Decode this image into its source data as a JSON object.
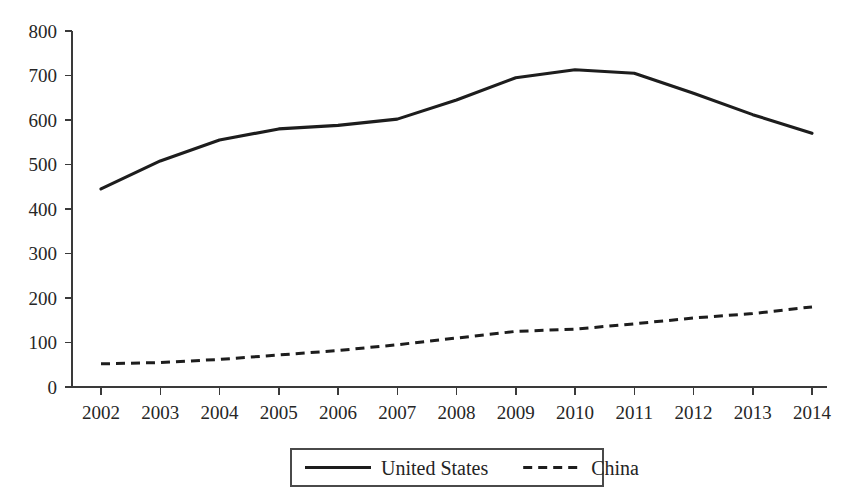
{
  "chart_data": {
    "type": "line",
    "title": "",
    "subtitle": "",
    "xlabel": "",
    "ylabel": "",
    "categories": [
      "2002",
      "2003",
      "2004",
      "2005",
      "2006",
      "2007",
      "2008",
      "2009",
      "2010",
      "2011",
      "2012",
      "2013",
      "2014"
    ],
    "x": [
      2002,
      2003,
      2004,
      2005,
      2006,
      2007,
      2008,
      2009,
      2010,
      2011,
      2012,
      2013,
      2014
    ],
    "series": [
      {
        "name": "United States",
        "style": "solid",
        "color": "#1d1d1d",
        "values": [
          445,
          508,
          555,
          580,
          588,
          602,
          645,
          695,
          713,
          705,
          660,
          612,
          570
        ]
      },
      {
        "name": "China",
        "style": "dashed",
        "color": "#1d1d1d",
        "values": [
          52,
          55,
          62,
          72,
          82,
          95,
          110,
          125,
          130,
          142,
          155,
          165,
          180
        ]
      }
    ],
    "ylim": [
      0,
      800
    ],
    "ytick_labels": [
      "0",
      "100",
      "200",
      "300",
      "400",
      "500",
      "600",
      "700",
      "800"
    ],
    "ytick_values": [
      0,
      100,
      200,
      300,
      400,
      500,
      600,
      700,
      800
    ],
    "xlim": [
      2002,
      2014
    ],
    "grid": false,
    "legend_position": "bottom-center",
    "legend_entries": [
      {
        "label": "United States",
        "style": "solid"
      },
      {
        "label": "China",
        "style": "dashed"
      }
    ]
  }
}
